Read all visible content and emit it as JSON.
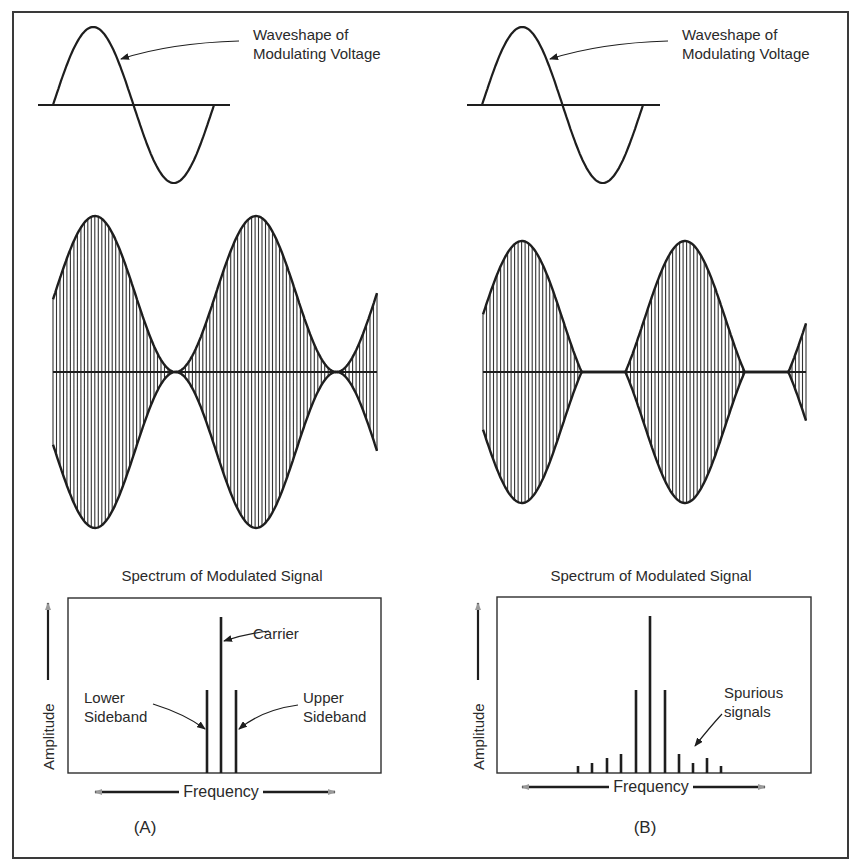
{
  "figure": {
    "panels": [
      {
        "id": "A",
        "label": "(A)",
        "modulating_label": "Waveshape of\nModulating Voltage",
        "spectrum_title": "Spectrum of Modulated Signal",
        "y_axis_label": "Amplitude",
        "x_axis_label": "Frequency",
        "annotations": {
          "carrier": "Carrier",
          "lower_sideband": "Lower\nSideband",
          "upper_sideband": "Upper\nSideband"
        }
      },
      {
        "id": "B",
        "label": "(B)",
        "modulating_label": "Waveshape of\nModulating Voltage",
        "spectrum_title": "Spectrum of Modulated Signal",
        "y_axis_label": "Amplitude",
        "x_axis_label": "Frequency",
        "annotations": {
          "spurious": "Spurious\nsignals"
        }
      }
    ]
  },
  "chart_data": [
    {
      "type": "line",
      "title": "Waveshape of Modulating Voltage (A)",
      "description": "One cycle of sine wave modulating voltage",
      "x": [
        0,
        90,
        180,
        270,
        360
      ],
      "values": [
        0,
        1,
        0,
        -1,
        0
      ]
    },
    {
      "type": "area",
      "title": "Modulated signal (A) - 100% modulation",
      "description": "AM carrier with envelope reaching zero at troughs",
      "modulation_index": 1.0,
      "envelope_max": 1.0,
      "envelope_min": 0.0
    },
    {
      "type": "bar",
      "title": "Spectrum of Modulated Signal (A)",
      "xlabel": "Frequency",
      "ylabel": "Amplitude",
      "categories": [
        "Lower Sideband",
        "Carrier",
        "Upper Sideband"
      ],
      "values": [
        0.5,
        1.0,
        0.5
      ]
    },
    {
      "type": "line",
      "title": "Waveshape of Modulating Voltage (B)",
      "description": "One cycle of sine wave modulating voltage",
      "x": [
        0,
        90,
        180,
        270,
        360
      ],
      "values": [
        0,
        1,
        0,
        -1,
        0
      ]
    },
    {
      "type": "area",
      "title": "Modulated signal (B) - overmodulation",
      "description": "AM carrier cut off to zero over part of each cycle",
      "modulation_index": ">1"
    },
    {
      "type": "bar",
      "title": "Spectrum of Modulated Signal (B)",
      "xlabel": "Frequency",
      "ylabel": "Amplitude",
      "categories": [
        "S-4",
        "S-3",
        "S-2",
        "S-1",
        "Lower Sideband",
        "Carrier",
        "Upper Sideband",
        "S+1",
        "S+2",
        "S+3",
        "S+4"
      ],
      "values": [
        0.04,
        0.06,
        0.09,
        0.11,
        0.5,
        1.0,
        0.5,
        0.11,
        0.09,
        0.06,
        0.04
      ],
      "annotations": [
        "Spurious signals"
      ]
    }
  ],
  "geometry": {
    "frame": [
      13,
      12,
      835,
      846
    ],
    "panels": [
      {
        "mod": {
          "x0": 53,
          "x1": 214,
          "axis_y": 105,
          "axis_x0": 38,
          "axis_x1": 230,
          "amp": 78
        },
        "mod_label": [
          253,
          25
        ],
        "mod_arrow": {
          "from": [
            239,
            41
          ],
          "ctrl": [
            170,
            43
          ],
          "to": [
            121,
            59
          ]
        },
        "am": {
          "x0": 53,
          "x1": 377,
          "cy": 372,
          "amp": 156,
          "m": 1.0,
          "period": 161,
          "peak_x": 95,
          "carriers": 46
        },
        "spec": {
          "box": [
            68,
            598,
            313,
            175
          ],
          "title_x": 222,
          "title_y": 567
        },
        "lines": [
          {
            "x": 207,
            "top": 690
          },
          {
            "x": 221,
            "top": 617
          },
          {
            "x": 236,
            "top": 690
          }
        ],
        "labels": [
          {
            "key": "carrier",
            "x": 253,
            "y": 624
          },
          {
            "key": "lower_sideband",
            "x": 84,
            "y": 688
          },
          {
            "key": "upper_sideband",
            "x": 303,
            "y": 688
          }
        ],
        "arrows": [
          {
            "from": [
              269,
              631
            ],
            "ctrl": [
              245,
              634
            ],
            "to": [
              224,
              641
            ]
          },
          {
            "from": [
              153,
              704
            ],
            "ctrl": [
              185,
              714
            ],
            "to": [
              205,
              729
            ]
          },
          {
            "from": [
              298,
              705
            ],
            "ctrl": [
              262,
              710
            ],
            "to": [
              239,
              729
            ]
          }
        ],
        "amp_axis": {
          "x": 48,
          "top": 603,
          "bottom": 680,
          "label_x": 40,
          "label_y": 770
        },
        "freq_axis": {
          "y": 792,
          "x0": 95,
          "x1": 335,
          "label_x": 221,
          "gap": 42
        },
        "panel_label": [
          145,
          818
        ]
      },
      {
        "mod": {
          "x0": 482,
          "x1": 643,
          "axis_y": 105,
          "axis_x0": 467,
          "axis_x1": 660,
          "amp": 78
        },
        "mod_label": [
          682,
          25
        ],
        "mod_arrow": {
          "from": [
            668,
            41
          ],
          "ctrl": [
            600,
            43
          ],
          "to": [
            550,
            59
          ]
        },
        "am": {
          "x0": 483,
          "x1": 806,
          "cy": 372,
          "amp": 131,
          "m": 1.5,
          "period": 163,
          "peak_x": 522,
          "carriers": 46
        },
        "spec": {
          "box": [
            497,
            597,
            314,
            176
          ],
          "title_x": 651,
          "title_y": 567
        },
        "lines": [
          {
            "x": 578,
            "top": 766
          },
          {
            "x": 592,
            "top": 763
          },
          {
            "x": 607,
            "top": 758
          },
          {
            "x": 621,
            "top": 754
          },
          {
            "x": 636,
            "top": 690
          },
          {
            "x": 650,
            "top": 616
          },
          {
            "x": 665,
            "top": 690
          },
          {
            "x": 679,
            "top": 754
          },
          {
            "x": 693,
            "top": 763
          },
          {
            "x": 707,
            "top": 758
          },
          {
            "x": 721,
            "top": 766
          }
        ],
        "labels": [
          {
            "key": "spurious",
            "x": 724,
            "y": 683
          }
        ],
        "arrows": [
          {
            "from": [
              722,
              714
            ],
            "ctrl": [
              710,
              727
            ],
            "to": [
              695,
              746
            ]
          }
        ],
        "amp_axis": {
          "x": 478,
          "top": 603,
          "bottom": 680,
          "label_x": 470,
          "label_y": 770
        },
        "freq_axis": {
          "y": 787,
          "x0": 522,
          "x1": 765,
          "label_x": 651,
          "gap": 42
        },
        "panel_label": [
          645,
          818
        ]
      }
    ]
  }
}
